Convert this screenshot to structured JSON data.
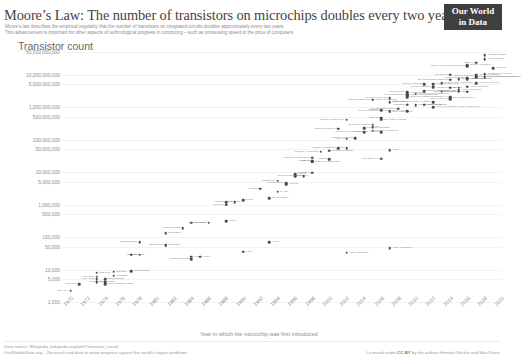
{
  "header": {
    "title": "Moore’s Law: The number of transistors on microchips doubles every two years",
    "subtitle_line1": "Moore’s law describes the empirical regularity that the number of transistors on integrated circuits doubles approximately every two years.",
    "subtitle_line2": "This advancement is important for other aspects of technological progress in computing – such as processing speed or the price of computers.",
    "logo_line1": "Our World",
    "logo_line2": "in Data"
  },
  "footer": {
    "source_line1": "Data source: Wikipedia (wikipedia.org/wiki/Transistor_count)",
    "source_line2": "OurWorldinData.org – Research and data to make progress against the world’s largest problems.",
    "license_prefix": "Licensed under ",
    "license_name": "CC-BY",
    "license_suffix": " by the authors Hannah Ritchie and Max Roser"
  },
  "chart_data": {
    "type": "scatter",
    "title": "Moore’s Law: The number of transistors on microchips doubles every two years",
    "ylabel": "Transistor count",
    "xlabel": "Year in which the microchip was first introduced",
    "yscale": "log",
    "ylim": [
      1000,
      50000000000
    ],
    "xlim": [
      1970,
      2021
    ],
    "grid": "horizontal",
    "legend": "none",
    "ytick_labels": [
      "50,000,000,000",
      "10,000,000,000",
      "5,000,000,000",
      "1,000,000,000",
      "500,000,000",
      "100,000,000",
      "50,000,000",
      "10,000,000",
      "5,000,000",
      "1,000,000",
      "500,000",
      "100,000",
      "50,000",
      "10,000",
      "5,000",
      "1,000"
    ],
    "ytick_values": [
      50000000000,
      10000000000,
      5000000000,
      1000000000,
      500000000,
      100000000,
      50000000,
      10000000,
      5000000,
      1000000,
      500000,
      100000,
      50000,
      10000,
      5000,
      1000
    ],
    "xtick_labels": [
      "1970",
      "1972",
      "1974",
      "1976",
      "1978",
      "1980",
      "1982",
      "1984",
      "1986",
      "1988",
      "1990",
      "1992",
      "1994",
      "1996",
      "1998",
      "2000",
      "2002",
      "2004",
      "2006",
      "2008",
      "2010",
      "2012",
      "2014",
      "2016",
      "2018",
      "2020"
    ],
    "points": [
      {
        "label": "Intel 4004",
        "year": 1971,
        "count": 2250,
        "side": "l"
      },
      {
        "label": "Intel 8008",
        "year": 1972,
        "count": 3500,
        "side": "l"
      },
      {
        "label": "MOS Technology 6502",
        "year": 1975,
        "count": 3510,
        "side": "r"
      },
      {
        "label": "Motorola 6800",
        "year": 1974,
        "count": 4100,
        "side": "r"
      },
      {
        "label": "Intel 8080",
        "year": 1974,
        "count": 6000,
        "side": "l"
      },
      {
        "label": "RCA 1802",
        "year": 1974,
        "count": 5000,
        "side": "l"
      },
      {
        "label": "Zilog Z80",
        "year": 1976,
        "count": 8500,
        "side": "r"
      },
      {
        "label": "Intel 8085",
        "year": 1976,
        "count": 6500,
        "side": "r"
      },
      {
        "label": "Motorola 6809",
        "year": 1978,
        "count": 9000,
        "side": "r"
      },
      {
        "label": "Intel 8086",
        "year": 1978,
        "count": 29000,
        "side": "r"
      },
      {
        "label": "Intel 8088",
        "year": 1979,
        "count": 29000,
        "side": "l"
      },
      {
        "label": "TMS 1000",
        "year": 1974,
        "count": 8000,
        "side": "r"
      },
      {
        "label": "Motorola 68000",
        "year": 1979,
        "count": 68000,
        "side": "l"
      },
      {
        "label": "Intel 80186",
        "year": 1982,
        "count": 55000,
        "side": "r"
      },
      {
        "label": "Intel 80286",
        "year": 1982,
        "count": 134000,
        "side": "r"
      },
      {
        "label": "Motorola 68020",
        "year": 1984,
        "count": 190000,
        "side": "l"
      },
      {
        "label": "Intel 80386",
        "year": 1985,
        "count": 275000,
        "side": "r"
      },
      {
        "label": "ARM 2",
        "year": 1986,
        "count": 25000,
        "side": "r"
      },
      {
        "label": "Motorola 68030",
        "year": 1987,
        "count": 273000,
        "side": "l"
      },
      {
        "label": "Intel 80486",
        "year": 1989,
        "count": 1180000,
        "side": "r"
      },
      {
        "label": "R4000",
        "year": 1991,
        "count": 1350000,
        "side": "r"
      },
      {
        "label": "ARM 7",
        "year": 1994,
        "count": 68000,
        "side": "r"
      },
      {
        "label": "Pentium",
        "year": 1993,
        "count": 3100000,
        "side": "l"
      },
      {
        "label": "Pentium Pro",
        "year": 1995,
        "count": 5500000,
        "side": "l"
      },
      {
        "label": "AMD K5",
        "year": 1996,
        "count": 4300000,
        "side": "r"
      },
      {
        "label": "Pentium II",
        "year": 1997,
        "count": 7500000,
        "side": "r"
      },
      {
        "label": "AMD K6",
        "year": 1997,
        "count": 8800000,
        "side": "r"
      },
      {
        "label": "Pentium III",
        "year": 1999,
        "count": 9500000,
        "side": "l"
      },
      {
        "label": "AMD K7",
        "year": 1999,
        "count": 22000000,
        "side": "l"
      },
      {
        "label": "Pentium 4 Willamette",
        "year": 2000,
        "count": 42000000,
        "side": "l"
      },
      {
        "label": "AMD K8",
        "year": 2003,
        "count": 105900000,
        "side": "l"
      },
      {
        "label": "Pentium 4 Northwood",
        "year": 2002,
        "count": 55000000,
        "side": "l"
      },
      {
        "label": "Pentium 4 Prescott",
        "year": 2004,
        "count": 112000000,
        "side": "l"
      },
      {
        "label": "Itanium 2 McKinley",
        "year": 2002,
        "count": 220000000,
        "side": "l"
      },
      {
        "label": "Itanium 2 Madison 6M",
        "year": 2003,
        "count": 410000000,
        "side": "l"
      },
      {
        "label": "Pentium D Smithfield",
        "year": 2005,
        "count": 228000000,
        "side": "r"
      },
      {
        "label": "Core 2 Duo Wolfdale",
        "year": 2007,
        "count": 411000000,
        "side": "r"
      },
      {
        "label": "Cell",
        "year": 2006,
        "count": 241000000,
        "side": "r"
      },
      {
        "label": "Core 2 Duo Conroe",
        "year": 2006,
        "count": 291000000,
        "side": "l"
      },
      {
        "label": "Atom",
        "year": 2008,
        "count": 47000000,
        "side": "r"
      },
      {
        "label": "Core i7 Bloomfield",
        "year": 2008,
        "count": 731000000,
        "side": "r"
      },
      {
        "label": "Dual-core Itanium 2",
        "year": 2006,
        "count": 1700000000,
        "side": "l"
      },
      {
        "label": "Quad-core Itanium Tukwila",
        "year": 2010,
        "count": 2000000000,
        "side": "r"
      },
      {
        "label": "Six-core Xeon 7400",
        "year": 2008,
        "count": 1900000000,
        "side": "l"
      },
      {
        "label": "8-core Xeon Nehalem-EX",
        "year": 2010,
        "count": 2300000000,
        "side": "r"
      },
      {
        "label": "10-core Xeon Westmere-EX",
        "year": 2011,
        "count": 2600000000,
        "side": "r"
      },
      {
        "label": "Quad-core + GPU Core i7 Haswell",
        "year": 2013,
        "count": 1400000000,
        "side": "l"
      },
      {
        "label": "Apple A7 (dual-core ARM64 mobile SoC)",
        "year": 2013,
        "count": 1000000000,
        "side": "r"
      },
      {
        "label": "Xbox One main SoC",
        "year": 2013,
        "count": 5000000000,
        "side": "r"
      },
      {
        "label": "61-core Xeon Phi",
        "year": 2012,
        "count": 5000000000,
        "side": "l"
      },
      {
        "label": "12-core POWER8",
        "year": 2013,
        "count": 4200000000,
        "side": "l"
      },
      {
        "label": "18-core Xeon Haswell-E5",
        "year": 2014,
        "count": 5560000000,
        "side": "r"
      },
      {
        "label": "Apple A8X",
        "year": 2014,
        "count": 3000000000,
        "side": "r"
      },
      {
        "label": "22-core Xeon Broadwell-E5",
        "year": 2016,
        "count": 7200000000,
        "side": "r"
      },
      {
        "label": "IBM z13 Storage Controller",
        "year": 2015,
        "count": 7100000000,
        "side": "l"
      },
      {
        "label": "SPARC M7",
        "year": 2015,
        "count": 10000000000,
        "side": "l"
      },
      {
        "label": "32-core AMD Epyc",
        "year": 2017,
        "count": 19200000000,
        "side": "r"
      },
      {
        "label": "Apple A12X Bionic",
        "year": 2018,
        "count": 10000000000,
        "side": "r"
      },
      {
        "label": "Qualcomm Snapdragon 8cx/SCX8180",
        "year": 2018,
        "count": 8500000000,
        "side": "r"
      },
      {
        "label": "HiSilicon Kirin 990 5G",
        "year": 2019,
        "count": 10300000000,
        "side": "r"
      },
      {
        "label": "AWS Graviton2",
        "year": 2019,
        "count": 30000000000,
        "side": "r"
      },
      {
        "label": "Apple M1",
        "year": 2020,
        "count": 16000000000,
        "side": "r"
      },
      {
        "label": "AMD Epyc Rome",
        "year": 2019,
        "count": 39540000000,
        "side": "r"
      },
      {
        "label": "GC2 IPU",
        "year": 2018,
        "count": 23600000000,
        "side": "l"
      },
      {
        "label": "72-core Xeon Phi Centriq 2400",
        "year": 2017,
        "count": 18000000000,
        "side": "l"
      },
      {
        "label": "Tegra Xavier SoC",
        "year": 2018,
        "count": 9000000000,
        "side": "l"
      },
      {
        "label": "Apple A13 (iPhone 11 Pro)",
        "year": 2019,
        "count": 8500000000,
        "side": "r"
      },
      {
        "label": "HiSilicon Kirin 710",
        "year": 2018,
        "count": 5500000000,
        "side": "r"
      },
      {
        "label": "12-core POWER9",
        "year": 2017,
        "count": 8000000000,
        "side": "l"
      },
      {
        "label": "Qualcomm Snapdragon 835",
        "year": 2017,
        "count": 3000000000,
        "side": "l"
      },
      {
        "label": "HiSilicon Kirin 960",
        "year": 2016,
        "count": 4000000000,
        "side": "l"
      },
      {
        "label": "Core i7 Skylake",
        "year": 2015,
        "count": 1750000000,
        "side": "l"
      },
      {
        "label": "Apple A10 Fusion",
        "year": 2016,
        "count": 3300000000,
        "side": "r"
      },
      {
        "label": "Apple A11 Bionic",
        "year": 2017,
        "count": 4300000000,
        "side": "r"
      },
      {
        "label": "Apple A9",
        "year": 2015,
        "count": 2000000000,
        "side": "l"
      },
      {
        "label": "Core i7 Broadwell-U",
        "year": 2015,
        "count": 1900000000,
        "side": "r"
      },
      {
        "label": "Snapdragon 821",
        "year": 2016,
        "count": 3100000000,
        "side": "l"
      },
      {
        "label": "Pentium 4 Cedar Mill",
        "year": 2006,
        "count": 188000000,
        "side": "r"
      },
      {
        "label": "Pentium 4 Prescott-2M",
        "year": 2005,
        "count": 169000000,
        "side": "l"
      },
      {
        "label": "Itanium 2 Montecito",
        "year": 2006,
        "count": 1720000000,
        "side": "r"
      },
      {
        "label": "Core i7 Sandy Bridge",
        "year": 2011,
        "count": 1160000000,
        "side": "r"
      },
      {
        "label": "Core 2 Duo Allendale",
        "year": 2007,
        "count": 169000000,
        "side": "l"
      },
      {
        "label": "Barton",
        "year": 2003,
        "count": 54300000,
        "side": "l"
      },
      {
        "label": "ARM Cortex-A9",
        "year": 2007,
        "count": 26000000,
        "side": "l"
      },
      {
        "label": "Core i7 Ivy Bridge",
        "year": 2012,
        "count": 1200000000,
        "side": "r"
      },
      {
        "label": "POWER6",
        "year": 2007,
        "count": 790000000,
        "side": "l"
      },
      {
        "label": "Itanium 2 Poulson",
        "year": 2012,
        "count": 3100000000,
        "side": "r"
      },
      {
        "label": "SPARC64 VIIIfx",
        "year": 2010,
        "count": 760000000,
        "side": "l"
      },
      {
        "label": "POWER7",
        "year": 2010,
        "count": 1200000000,
        "side": "l"
      },
      {
        "label": "Nvidia GT200",
        "year": 2008,
        "count": 1400000000,
        "side": "r"
      },
      {
        "label": "AMD Cayman",
        "year": 2010,
        "count": 2640000000,
        "side": "r"
      },
      {
        "label": "Nvidia GF100",
        "year": 2010,
        "count": 3000000000,
        "side": "l"
      },
      {
        "label": "Six-core Opteron 2400",
        "year": 2009,
        "count": 904000000,
        "side": "l"
      },
      {
        "label": "AMD K10 quad-core 2M L3",
        "year": 2008,
        "count": 758000000,
        "side": "l"
      },
      {
        "label": "AMD K10",
        "year": 2007,
        "count": 463000000,
        "side": "l"
      },
      {
        "label": "Core i7 Skylake-X",
        "year": 2017,
        "count": 7200000000,
        "side": "r"
      },
      {
        "label": "IBM z13",
        "year": 2015,
        "count": 3990000000,
        "side": "r"
      },
      {
        "label": "Xeon Nehalem-EX",
        "year": 2010,
        "count": 2300000000,
        "side": "l"
      },
      {
        "label": "Pentium II Deschutes",
        "year": 1998,
        "count": 7500000,
        "side": "l"
      },
      {
        "label": "Pentium II Mobile Dixon",
        "year": 1999,
        "count": 27400000,
        "side": "l"
      },
      {
        "label": "AMD K6-III",
        "year": 1999,
        "count": 21300000,
        "side": "l"
      },
      {
        "label": "Pentium III Coppermine",
        "year": 1999,
        "count": 21000000,
        "side": "r"
      },
      {
        "label": "Pentium III Tualatin",
        "year": 2001,
        "count": 45000000,
        "side": "r"
      },
      {
        "label": "Itanium",
        "year": 2001,
        "count": 25000000,
        "side": "l"
      },
      {
        "label": "ARM 3",
        "year": 1989,
        "count": 310000,
        "side": "r"
      },
      {
        "label": "SA-110",
        "year": 1995,
        "count": 2500000,
        "side": "r"
      },
      {
        "label": "Pentium MMX",
        "year": 1996,
        "count": 4500000,
        "side": "l"
      },
      {
        "label": "Intel 80486DX4",
        "year": 1994,
        "count": 1600000,
        "side": "r"
      },
      {
        "label": "Motorola 68040",
        "year": 1990,
        "count": 1200000,
        "side": "l"
      },
      {
        "label": "Intel i860",
        "year": 1989,
        "count": 1000000,
        "side": "l"
      },
      {
        "label": "ARM 6",
        "year": 1991,
        "count": 35000,
        "side": "r"
      },
      {
        "label": "ARM 1",
        "year": 1985,
        "count": 25000,
        "side": "r"
      },
      {
        "label": "Intel 80186 2",
        "year": 1982,
        "count": 55000,
        "side": "l"
      },
      {
        "label": "Motorola 68HC11",
        "year": 1985,
        "count": 21000,
        "side": "l"
      },
      {
        "label": "Intersil 6100",
        "year": 1975,
        "count": 4000,
        "side": "l"
      },
      {
        "label": "Signetics 2650",
        "year": 1975,
        "count": 5000,
        "side": "r"
      },
      {
        "label": "Atmel ATmega32",
        "year": 2003,
        "count": 33000,
        "side": "r"
      },
      {
        "label": "Atmel ATmega644",
        "year": 2008,
        "count": 45000,
        "side": "r"
      }
    ]
  }
}
